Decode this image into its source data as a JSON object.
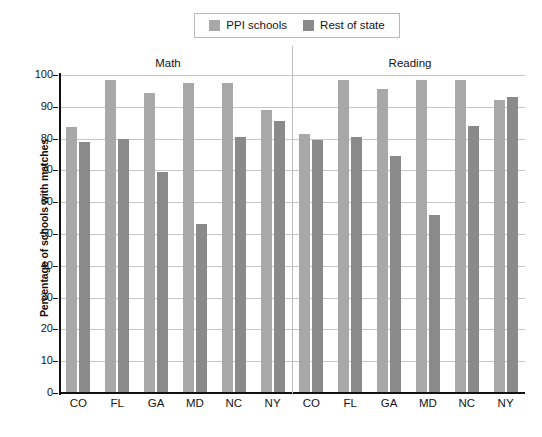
{
  "chart_data": {
    "type": "bar",
    "title": "",
    "subtitle": "",
    "xlabel": "",
    "ylabel": "Percentage of schools with matches",
    "ylim": [
      0,
      100
    ],
    "ytick_values": [
      0,
      10,
      20,
      30,
      40,
      50,
      60,
      70,
      80,
      90,
      100
    ],
    "ytick_labels": [
      "0",
      "10",
      "20",
      "30",
      "40",
      "50",
      "60",
      "70",
      "80",
      "90",
      "100"
    ],
    "grid": true,
    "legend_position": "top-center",
    "panels": [
      "Math",
      "Reading"
    ],
    "categories": [
      "CO",
      "FL",
      "GA",
      "MD",
      "NC",
      "NY",
      "CO",
      "FL",
      "GA",
      "MD",
      "NC",
      "NY"
    ],
    "series": [
      {
        "name": "PPI schools",
        "color": "#a8a8a8",
        "values": [
          83.5,
          98.5,
          94.5,
          97.5,
          97.5,
          89,
          81.5,
          98.5,
          95.5,
          98.5,
          98.5,
          92
        ]
      },
      {
        "name": "Rest of state",
        "color": "#8a8a8a",
        "values": [
          79,
          80,
          69.5,
          53,
          80.5,
          85.5,
          79.5,
          80.5,
          74.5,
          56,
          84,
          93
        ]
      }
    ],
    "panel_data": [
      {
        "panel": "Math",
        "categories": [
          "CO",
          "FL",
          "GA",
          "MD",
          "NC",
          "NY"
        ],
        "ppi_schools": [
          83.5,
          98.5,
          94.5,
          97.5,
          97.5,
          89
        ],
        "rest_of_state": [
          79,
          80,
          69.5,
          53,
          80.5,
          85.5
        ]
      },
      {
        "panel": "Reading",
        "categories": [
          "CO",
          "FL",
          "GA",
          "MD",
          "NC",
          "NY"
        ],
        "ppi_schools": [
          81.5,
          98.5,
          95.5,
          98.5,
          98.5,
          92
        ],
        "rest_of_state": [
          79.5,
          80.5,
          74.5,
          56,
          84,
          93
        ]
      }
    ]
  },
  "legend": {
    "items": [
      {
        "label": "PPI schools",
        "color": "#a8a8a8"
      },
      {
        "label": "Rest of state",
        "color": "#8a8a8a"
      }
    ]
  },
  "sections": {
    "math": "Math",
    "reading": "Reading"
  },
  "axes": {
    "y_title": "Percentage of schools with matches"
  },
  "colors": {
    "ppi": "#a8a8a8",
    "rest": "#8a8a8a",
    "axis": "#111111",
    "grid": "#c6c6c6",
    "background": "#ffffff"
  }
}
